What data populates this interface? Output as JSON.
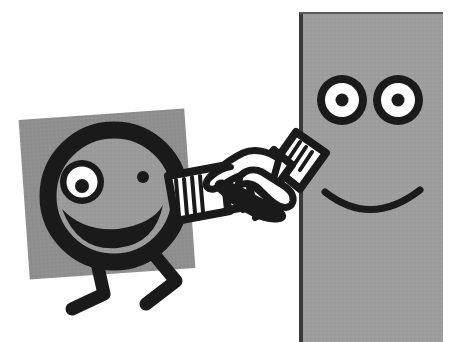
{
  "scene": {
    "title": "Reluctant Handshake",
    "description": "A worried round-headed stick figure shakes hands with a large calm rectangular figure",
    "canvas": {
      "width": 457,
      "height": 342,
      "background": "#ffffff"
    }
  },
  "palette": {
    "background": "#ffffff",
    "ink": "#1a1a1a",
    "gray_mid": "#9a9a9a",
    "gray_square": "#8e8e8e",
    "gray_panel": "#9d9d9d",
    "panel_edge": "#3a3a3a",
    "white": "#ffffff"
  },
  "left_figure": {
    "name": "worried-stick-figure",
    "mood": "worried",
    "backdrop_square": {
      "name": "gray-backdrop-square",
      "fill": "#8e8e8e",
      "x": 24,
      "y": 114,
      "width": 166,
      "height": 160,
      "rotation_deg": -4
    },
    "head": {
      "name": "round-head",
      "cx": 114,
      "cy": 196,
      "r": 73,
      "fill": "#9a9a9a",
      "stroke": "#1a1a1a",
      "stroke_width": 17
    },
    "eye_left": {
      "name": "large-white-eye",
      "cx": 82,
      "cy": 182,
      "r_outer": 22,
      "r_white": 16,
      "r_pupil": 7,
      "ring": "#1a1a1a",
      "white": "#ffffff",
      "pupil": "#1a1a1a"
    },
    "eye_right": {
      "name": "small-dot-eye",
      "cx": 143,
      "cy": 177,
      "r": 6,
      "fill": "#1a1a1a"
    },
    "mouth": {
      "name": "frown-mouth",
      "shape": "downward-curve",
      "stroke": "#1a1a1a"
    },
    "legs": [
      {
        "name": "leg-front",
        "foot_direction": "left"
      },
      {
        "name": "leg-back",
        "foot_direction": "left"
      }
    ],
    "arm": {
      "name": "left-figure-arm",
      "cuff_hatch_lines": 6,
      "cuff_fill": "#ffffff",
      "stroke": "#1a1a1a"
    }
  },
  "right_figure": {
    "name": "calm-rectangular-figure",
    "mood": "calm",
    "panel": {
      "name": "gray-body-panel",
      "fill": "#9d9d9d",
      "edge": "#3a3a3a",
      "x": 299,
      "y": 12,
      "width": 144,
      "height": 330
    },
    "eye_left": {
      "name": "left-ring-eye",
      "cx": 342,
      "cy": 100,
      "r_outer": 25,
      "r_white": 17,
      "r_pupil": 6,
      "ring": "#1a1a1a",
      "white": "#ffffff",
      "pupil": "#1a1a1a"
    },
    "eye_right": {
      "name": "right-ring-eye",
      "cx": 398,
      "cy": 100,
      "r_outer": 25,
      "r_white": 17,
      "r_pupil": 6,
      "ring": "#1a1a1a",
      "white": "#ffffff",
      "pupil": "#1a1a1a"
    },
    "mouth": {
      "name": "smile-mouth",
      "shape": "upward-arc",
      "stroke": "#1a1a1a",
      "stroke_width": 7
    },
    "arm": {
      "name": "right-figure-arm",
      "cuff_hatch_lines": 5,
      "cuff_fill": "#ffffff",
      "stroke": "#1a1a1a"
    }
  },
  "handshake": {
    "name": "clasped-hands",
    "fill": "#ffffff",
    "stroke": "#1a1a1a",
    "stroke_width": 7,
    "center_x": 247,
    "center_y": 184
  }
}
